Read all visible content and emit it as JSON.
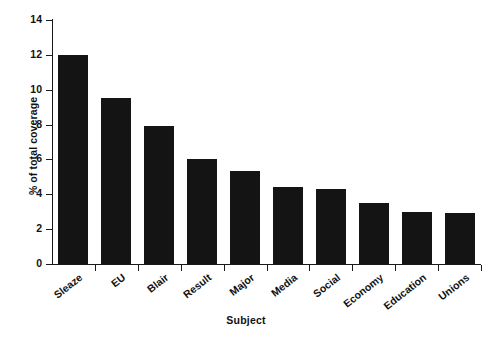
{
  "chart_data": {
    "type": "bar",
    "title": "",
    "xlabel": "Subject",
    "ylabel": "% of total coverage",
    "categories": [
      "Sleaze",
      "EU",
      "Blair",
      "Result",
      "Major",
      "Media",
      "Social",
      "Economy",
      "Education",
      "Unions"
    ],
    "values": [
      12.0,
      9.5,
      7.9,
      6.05,
      5.35,
      4.4,
      4.3,
      3.5,
      3.0,
      2.9
    ],
    "ylim": [
      0,
      14
    ],
    "ytick_labels": [
      "14",
      "12",
      "10",
      "8",
      "6",
      "4",
      "2",
      "0"
    ],
    "ytick_values": [
      14,
      12,
      10,
      8,
      6,
      4,
      2,
      0
    ],
    "ytick_step": 2,
    "grid": false,
    "legend": false,
    "bar_color": "#141414",
    "axis_color": "#1a1a1a",
    "background": "#ffffff"
  }
}
